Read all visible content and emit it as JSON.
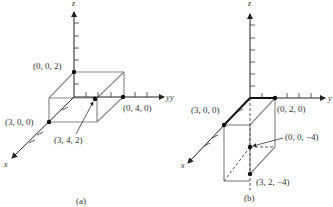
{
  "diagram": {
    "colors": {
      "axis": "#222222",
      "box": "#8a8a8a",
      "point": "#111111",
      "text": "#333333"
    },
    "panels": [
      {
        "caption": "(a)",
        "axes": {
          "x": "x",
          "y": "y",
          "z": "z"
        },
        "points": [
          {
            "label": "(0, 0, 2)"
          },
          {
            "label": "(0, 4, 0)"
          },
          {
            "label": "(3, 0, 0)"
          },
          {
            "label": "(3, 4, 2)"
          }
        ]
      },
      {
        "caption": "(b)",
        "axes": {
          "x": "x",
          "y": "y",
          "z": "z"
        },
        "stray_label": "y",
        "points": [
          {
            "label": "(3, 0, 0)"
          },
          {
            "label": "(0, 2, 0)"
          },
          {
            "label": "(0, 0, −4)"
          },
          {
            "label": "(3, 2, −4)"
          }
        ]
      }
    ]
  }
}
